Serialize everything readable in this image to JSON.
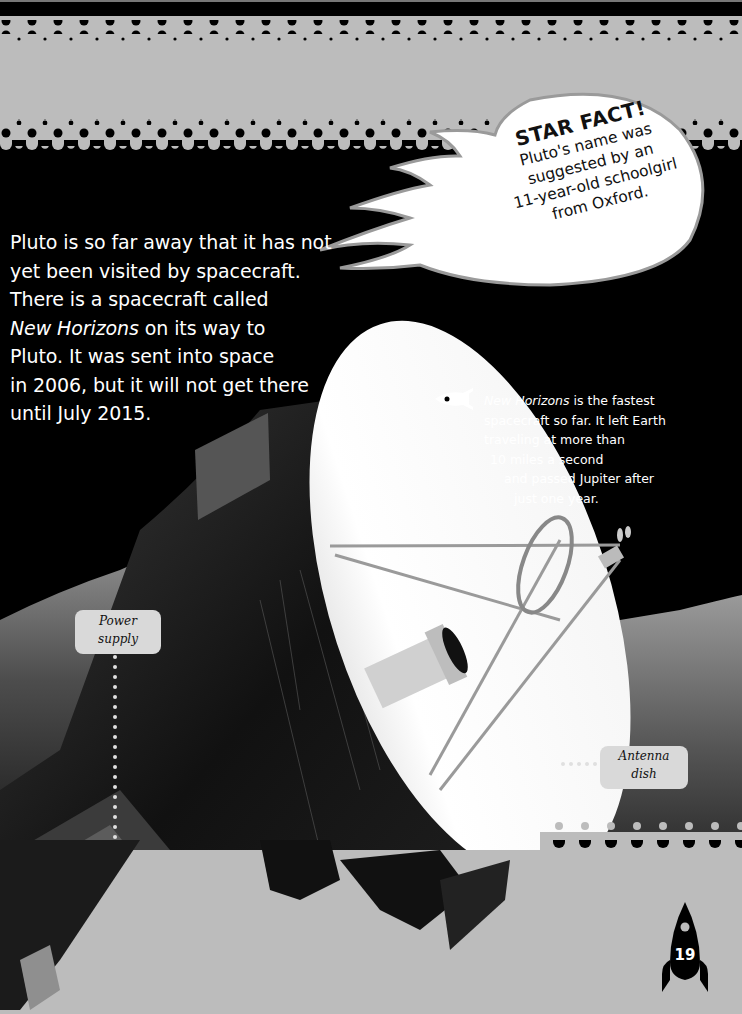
{
  "page": {
    "number": "19",
    "colors": {
      "band_gray": "#bcbcbc",
      "black": "#000000",
      "label_bg": "#d9d9d9",
      "text_white": "#ffffff"
    }
  },
  "body_text": {
    "line1": "Pluto is so far away that it has not",
    "line2": "yet been visited by spacecraft.",
    "line3": "There is a spacecraft called",
    "line4_italic": "New Horizons",
    "line4_rest": " on its way to",
    "line5": "Pluto. It was sent into space",
    "line6": "in 2006, but it will not get there",
    "line7": "until July 2015."
  },
  "star_fact": {
    "title": "STAR FACT!",
    "lines": [
      "Pluto's name was",
      "suggested by an",
      "11-year-old schoolgirl",
      "from Oxford."
    ]
  },
  "callout": {
    "icon": "rocket-icon",
    "italic": "New Horizons",
    "line1_rest": " is the fastest",
    "line2": "spacecraft so far. It left Earth",
    "line3": "traveling at more than",
    "line4": "10 miles a second",
    "line5": "and passed Jupiter after",
    "line6": "just one year."
  },
  "labels": {
    "power_supply": {
      "line1": "Power",
      "line2": "supply"
    },
    "antenna_dish": {
      "line1": "Antenna",
      "line2": "dish"
    }
  },
  "image": {
    "subject": "New Horizons spacecraft over Pluto landscape",
    "icon": "spacecraft-illustration"
  }
}
